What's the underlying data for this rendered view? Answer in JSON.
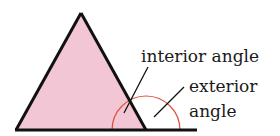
{
  "diagram": {
    "labels": {
      "interior": "interior angle",
      "exterior_line1": "exterior",
      "exterior_line2": "angle"
    },
    "colors": {
      "triangle_fill": "#f3c6d6",
      "outline": "#111111",
      "arc": "#e0503a"
    }
  }
}
